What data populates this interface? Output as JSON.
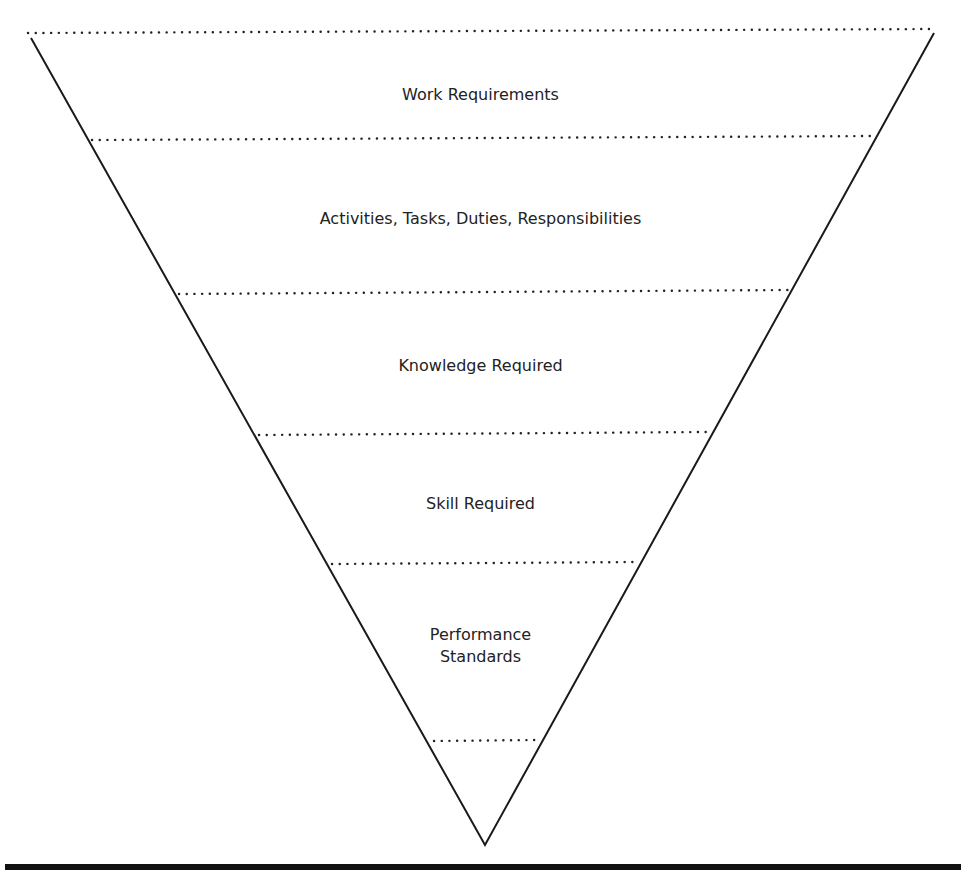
{
  "diagram": {
    "type": "inverted-pyramid",
    "colors": {
      "line": "#1a1a1a",
      "dots": "#222222",
      "text": "#222222",
      "background": "#ffffff",
      "bottom_bar": "#111111"
    },
    "layers": [
      {
        "label": "Work Requirements"
      },
      {
        "label": "Activities, Tasks, Duties, Responsibilities"
      },
      {
        "label": "Knowledge Required"
      },
      {
        "label": "Skill Required"
      },
      {
        "label": "Performance\nStandards"
      }
    ]
  }
}
